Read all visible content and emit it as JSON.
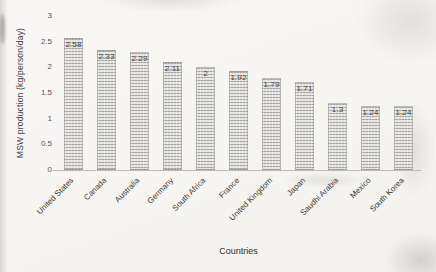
{
  "chart_data": {
    "type": "bar",
    "title": "",
    "xlabel": "Countries",
    "ylabel": "MSW production (kg/person/day)",
    "categories": [
      "United States",
      "Canada",
      "Australia",
      "Germany",
      "South Africa",
      "France",
      "United Kingdom",
      "Japan",
      "Saudhi Arabia",
      "Mexico",
      "South Korea"
    ],
    "values": [
      2.58,
      2.33,
      2.29,
      2.11,
      2,
      1.92,
      1.79,
      1.71,
      1.3,
      1.24,
      1.24
    ],
    "data_labels": [
      "2.58",
      "2.33",
      "2.29",
      "2.11",
      "2",
      "1.92",
      "1.79",
      "1.71",
      "1.3",
      "1.24",
      "1.24"
    ],
    "ylim": [
      0,
      3
    ],
    "yticks": [
      0,
      0.5,
      1,
      1.5,
      2,
      2.5,
      3
    ],
    "grid": false,
    "legend": "none",
    "data_label_position": "inside-end",
    "bar_fill": "#cfcecb",
    "bar_stripe": "#7b7a76",
    "value_label_color": "#454545",
    "tick_label_color": "#555452",
    "axis_line_color": "#bcbbb7",
    "background": "#f6f5f2"
  }
}
